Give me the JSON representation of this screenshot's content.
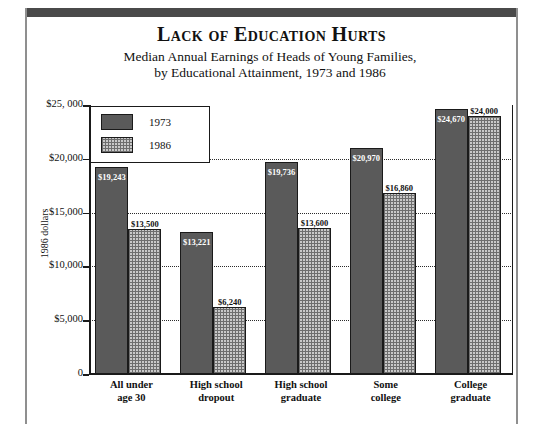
{
  "header": {
    "title": "Lack of Education Hurts",
    "subtitle_line1": "Median Annual Earnings of Heads of Young Families,",
    "subtitle_line2": "by Educational Attainment, 1973 and 1986"
  },
  "legend": {
    "items": [
      {
        "label": "1973",
        "swatch": "solid-dark-gray",
        "color": "#5a5a5a"
      },
      {
        "label": "1986",
        "swatch": "checkered-light-gray",
        "color": "#c9c9c9"
      }
    ]
  },
  "axis": {
    "y_label": "1986 dollars",
    "y_ticks": [
      {
        "value": 25000,
        "label": "$25, 000"
      },
      {
        "value": 20000,
        "label": "$20,000"
      },
      {
        "value": 15000,
        "label": "$15,000"
      },
      {
        "value": 10000,
        "label": "$10,000"
      },
      {
        "value": 5000,
        "label": "$5,000"
      },
      {
        "value": 0,
        "label": "0"
      }
    ]
  },
  "chart_data": {
    "type": "bar",
    "title": "Lack of Education Hurts",
    "subtitle": "Median Annual Earnings of Heads of Young Families, by Educational Attainment, 1973 and 1986",
    "xlabel": "",
    "ylabel": "1986 dollars",
    "ylim": [
      0,
      25000
    ],
    "grid": true,
    "legend_position": "top-left-inside",
    "categories": [
      "All under age 30",
      "High school dropout",
      "High school graduate",
      "Some college",
      "College graduate"
    ],
    "category_lines": [
      [
        "All under",
        "age 30"
      ],
      [
        "High school",
        "dropout"
      ],
      [
        "High school",
        "graduate"
      ],
      [
        "Some",
        "college"
      ],
      [
        "College",
        "graduate"
      ]
    ],
    "series": [
      {
        "name": "1973",
        "color": "#5a5a5a",
        "values": [
          19243,
          13221,
          19736,
          20970,
          24670
        ],
        "data_labels": [
          "$19,243",
          "$13,221",
          "$19,736",
          "$20,970",
          "$24,670"
        ],
        "label_placement": "inside-top"
      },
      {
        "name": "1986",
        "color": "#c9c9c9",
        "values": [
          13500,
          6240,
          13600,
          16860,
          24000
        ],
        "data_labels": [
          "$13,500",
          "$6,240",
          "$13,600",
          "$16,860",
          "$24,000"
        ],
        "label_placement": "above"
      }
    ]
  }
}
